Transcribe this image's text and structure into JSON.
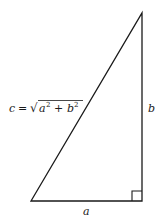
{
  "diagram": {
    "vertices": {
      "top": [
        142,
        13
      ],
      "bottom_right": [
        142,
        201
      ],
      "bottom_left": [
        31,
        201
      ]
    },
    "stroke_color": "#1a1a1a",
    "labels": {
      "hypotenuse_var": "c",
      "equals": "=",
      "radical": "√",
      "a_sq_base": "a",
      "a_sq_exp": "2",
      "plus": "+",
      "b_sq_base": "b",
      "b_sq_exp": "2",
      "side_b": "b",
      "side_a": "a"
    },
    "right_angle_marker": {
      "size": 10,
      "corner": "bottom_right"
    }
  }
}
